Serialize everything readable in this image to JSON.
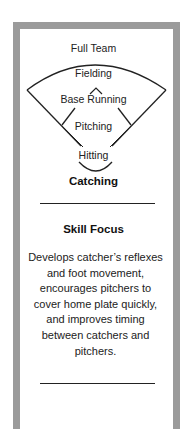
{
  "diagram": {
    "top_label": "Full Team",
    "levels": [
      {
        "label": "Fielding",
        "emphasis": false
      },
      {
        "label": "Base Running",
        "emphasis": false
      },
      {
        "label": "Pitching",
        "emphasis": false
      },
      {
        "label": "Hitting",
        "emphasis": false
      },
      {
        "label": "Catching",
        "emphasis": true
      }
    ]
  },
  "skill_focus": {
    "title": "Skill Focus",
    "description": "Develops catcher’s reflexes and foot movement, encourages pitchers to cover home plate quickly, and improves timing between catchers and pitchers."
  },
  "colors": {
    "frame": "#9b9b9b",
    "text": "#222222",
    "background": "#ffffff"
  }
}
